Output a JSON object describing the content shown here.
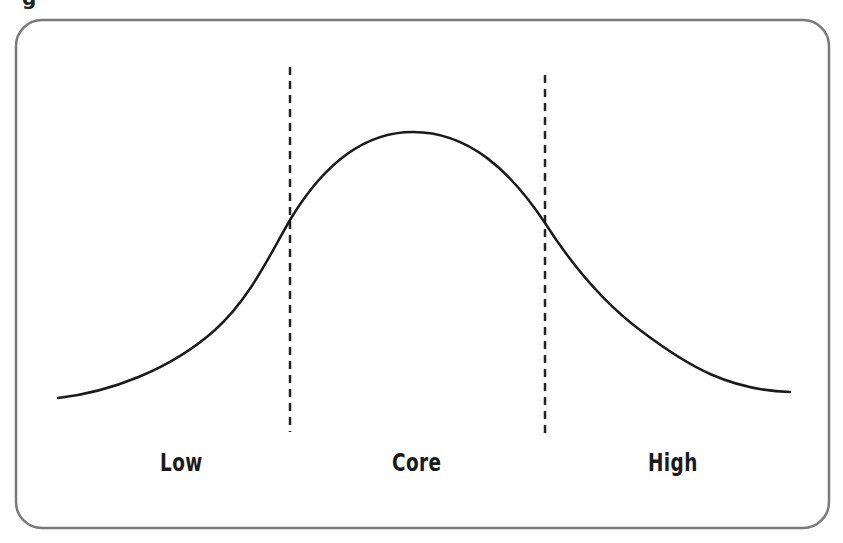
{
  "diagram": {
    "type": "bell-curve-segmentation",
    "top_edge_glyph": "g",
    "frame": {
      "x": 16,
      "y": 20,
      "width": 813,
      "height": 508,
      "radius": 26,
      "stroke": "#7a7a7a"
    },
    "curve": {
      "stroke": "#1a1a1a",
      "start": [
        58,
        398
      ],
      "peak": [
        413,
        132
      ],
      "end": [
        790,
        392
      ]
    },
    "dividers": [
      {
        "name": "low-core-divider",
        "x": 290,
        "y1": 67,
        "y2": 432
      },
      {
        "name": "core-high-divider",
        "x": 545,
        "y1": 75,
        "y2": 438
      }
    ],
    "regions": [
      {
        "label": "Low",
        "x": 160
      },
      {
        "label": "Core",
        "x": 392
      },
      {
        "label": "High",
        "x": 648
      }
    ]
  }
}
